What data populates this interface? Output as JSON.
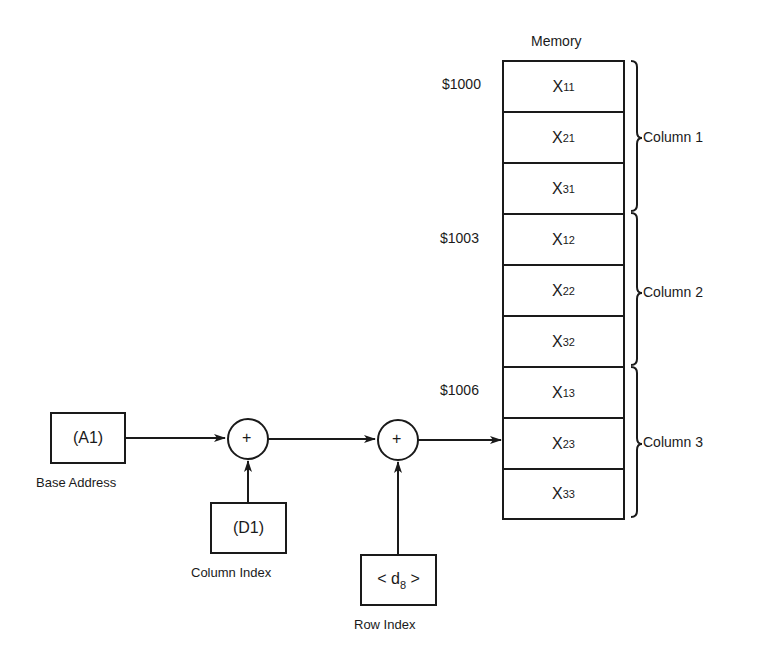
{
  "memory": {
    "title": "Memory",
    "cells": [
      {
        "var": "X",
        "sub": "11"
      },
      {
        "var": "X",
        "sub": "21"
      },
      {
        "var": "X",
        "sub": "31"
      },
      {
        "var": "X",
        "sub": "12"
      },
      {
        "var": "X",
        "sub": "22"
      },
      {
        "var": "X",
        "sub": "32"
      },
      {
        "var": "X",
        "sub": "13"
      },
      {
        "var": "X",
        "sub": "23"
      },
      {
        "var": "X",
        "sub": "33"
      }
    ],
    "addresses": [
      {
        "label": "$1000",
        "row": 0
      },
      {
        "label": "$1003",
        "row": 3
      },
      {
        "label": "$1006",
        "row": 6
      }
    ],
    "groups": [
      {
        "label": "Column 1"
      },
      {
        "label": "Column 2"
      },
      {
        "label": "Column 3"
      }
    ]
  },
  "blocks": {
    "base": {
      "text": "(A1)",
      "caption": "Base Address"
    },
    "column_index": {
      "text": "(D1)",
      "caption": "Column Index"
    },
    "row_index": {
      "pre": "< d",
      "sub": "8",
      "post": " >",
      "caption": "Row Index"
    }
  },
  "adders": [
    {
      "symbol": "+"
    },
    {
      "symbol": "+"
    }
  ]
}
